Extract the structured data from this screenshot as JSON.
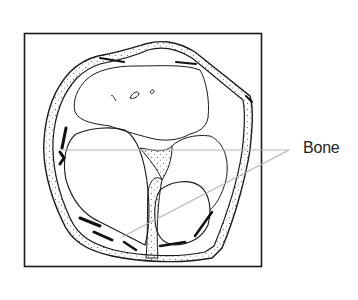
{
  "figure": {
    "type": "anatomical cross-section diagram",
    "labels": [
      {
        "id": "bone",
        "text": "Bone",
        "x": 303,
        "y": 139
      }
    ],
    "leader_lines": [
      {
        "from": [
          289,
          150
        ],
        "to": [
          62,
          150
        ]
      },
      {
        "from": [
          289,
          150
        ],
        "to": [
          122,
          237
        ]
      }
    ],
    "colors": {
      "ink": "#1a1a1a",
      "leader": "#b5b5b5",
      "stipple": "#555555",
      "background": "#ffffff"
    }
  }
}
